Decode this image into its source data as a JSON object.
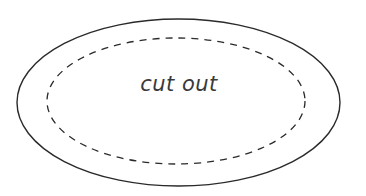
{
  "diagram": {
    "label": "cut out",
    "outer_shape": {
      "type": "ellipse",
      "stroke": "solid",
      "color": "#2a2a2a"
    },
    "inner_shape": {
      "type": "ellipse",
      "stroke": "dashed",
      "color": "#2a2a2a"
    }
  }
}
